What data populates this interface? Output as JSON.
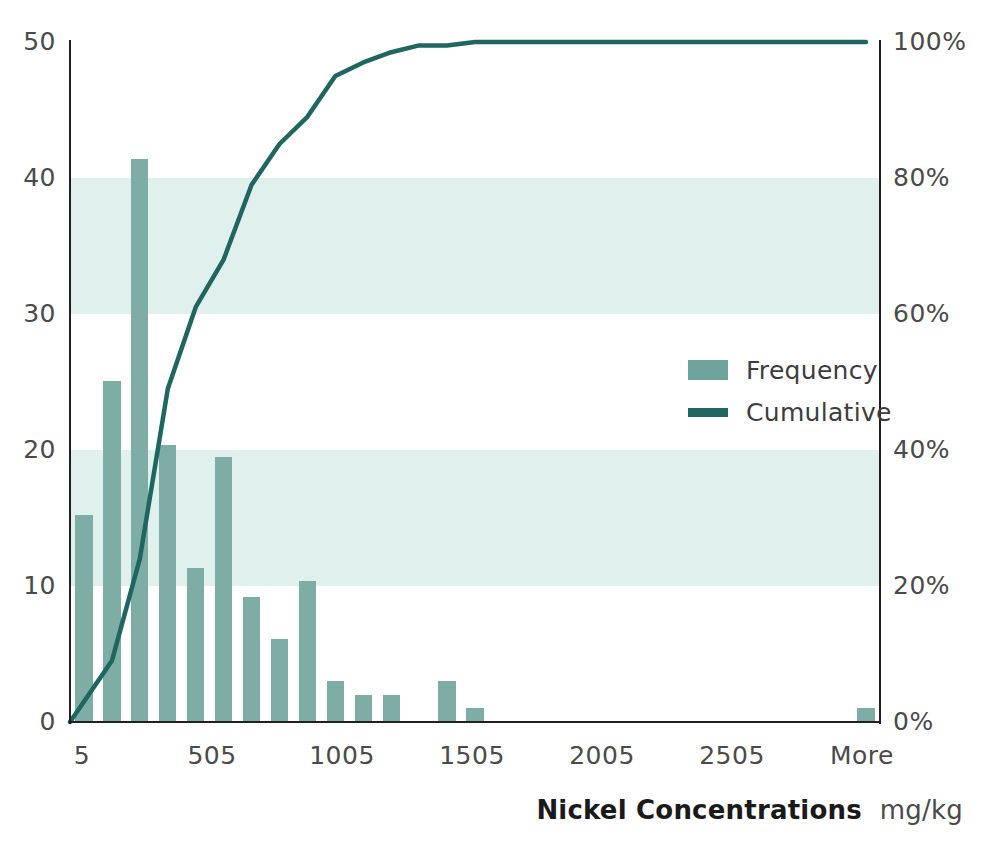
{
  "chart_data": {
    "type": "bar",
    "title": "",
    "xlabel": "Nickel Concentrations",
    "xunit": "mg/kg",
    "ylabel": "",
    "ylabel_right": "",
    "ylim": [
      0,
      50
    ],
    "ylim_right": [
      0,
      100
    ],
    "grid": false,
    "legend_position": "inside-right",
    "categories": [
      "5",
      "105",
      "205",
      "305",
      "405",
      "505",
      "605",
      "705",
      "805",
      "905",
      "1005",
      "1105",
      "1205",
      "1305",
      "1405",
      "1505",
      "1605",
      "1705",
      "1805",
      "1905",
      "2005",
      "2105",
      "2205",
      "2305",
      "2405",
      "2505",
      "2605",
      "2705",
      "More"
    ],
    "series": [
      {
        "name": "Frequency",
        "type": "bar",
        "color": "#7eada6",
        "values": [
          15.2,
          25.1,
          41.4,
          20.4,
          11.3,
          19.5,
          9.2,
          6.1,
          10.4,
          3.0,
          2.0,
          2.0,
          0,
          3.0,
          1.0,
          0,
          0,
          0,
          0,
          0,
          0,
          0,
          0,
          0,
          0,
          0,
          0,
          0,
          1.0
        ]
      },
      {
        "name": "Cumulative",
        "type": "line",
        "color": "#1f6660",
        "axis": "right",
        "values": [
          0,
          9,
          24,
          49,
          61,
          68,
          79,
          85,
          89,
          95,
          97,
          98.5,
          99.5,
          99.5,
          100,
          100,
          100,
          100,
          100,
          100,
          100,
          100,
          100,
          100,
          100,
          100,
          100,
          100,
          100
        ]
      }
    ],
    "yticks_left": [
      "0",
      "10",
      "20",
      "30",
      "40",
      "50"
    ],
    "yticks_left_values": [
      0,
      10,
      20,
      30,
      40,
      50
    ],
    "yticks_right": [
      "0%",
      "20%",
      "40%",
      "60%",
      "80%",
      "100%"
    ],
    "yticks_right_values": [
      0,
      20,
      40,
      60,
      80,
      100
    ],
    "xticks": [
      "5",
      "505",
      "1005",
      "1505",
      "2005",
      "2505",
      "More"
    ],
    "bands": [
      {
        "from": 10,
        "to": 20,
        "color": "#e0f1ed"
      },
      {
        "from": 30,
        "to": 40,
        "color": "#e0f1ed"
      }
    ],
    "colors": {
      "bar": "#7eada6",
      "line": "#1f6660",
      "band": "#e0f1ed",
      "axis": "#231f20",
      "tick_text": "#4a4a4a",
      "title_text": "#1a1a1a"
    }
  },
  "legend": {
    "items": [
      {
        "label": "Frequency",
        "kind": "box",
        "color": "#7eada6"
      },
      {
        "label": "Cumulative",
        "kind": "line",
        "color": "#1f6660"
      }
    ]
  },
  "axis_title": {
    "main": "Nickel Concentrations",
    "unit": "mg/kg"
  }
}
